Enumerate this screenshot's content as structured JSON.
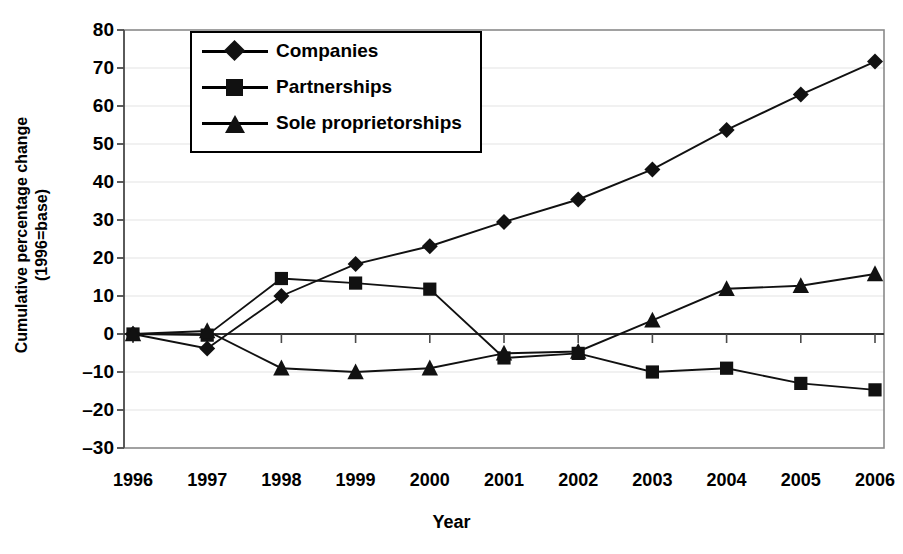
{
  "chart_data": {
    "type": "line",
    "title": "",
    "xlabel": "Year",
    "ylabel_line1": "Cumulative percentage change",
    "ylabel_line2": "(1996=base)",
    "categories": [
      "1996",
      "1997",
      "1998",
      "1999",
      "2000",
      "2001",
      "2002",
      "2003",
      "2004",
      "2005",
      "2006"
    ],
    "x": [
      1996,
      1997,
      1998,
      1999,
      2000,
      2001,
      2002,
      2003,
      2004,
      2005,
      2006
    ],
    "xlim": [
      1996,
      2006
    ],
    "ylim": [
      -30,
      80
    ],
    "yticks": [
      80,
      70,
      60,
      50,
      40,
      30,
      20,
      10,
      0,
      -10,
      -20,
      -30
    ],
    "ytick_labels": [
      "80",
      "70",
      "60",
      "50",
      "40",
      "30",
      "20",
      "10",
      "0",
      "–10",
      "–20",
      "–30"
    ],
    "grid": true,
    "grid_axis": "y",
    "legend_position": "top-left-inside",
    "zero_line": true,
    "series": [
      {
        "name": "Companies",
        "marker": "diamond",
        "values": [
          0,
          -3.8,
          10.0,
          18.4,
          23.1,
          29.5,
          35.4,
          43.3,
          53.7,
          63.0,
          71.7
        ]
      },
      {
        "name": "Partnerships",
        "marker": "square",
        "values": [
          0,
          -0.3,
          14.6,
          13.4,
          11.8,
          -6.3,
          -5.1,
          -10.0,
          -9.0,
          -13.0,
          -14.7
        ]
      },
      {
        "name": "Sole proprietorships",
        "marker": "triangle",
        "values": [
          0,
          0.8,
          -9.0,
          -10.0,
          -9.0,
          -5.1,
          -4.6,
          3.6,
          11.9,
          12.7,
          15.8
        ]
      }
    ]
  },
  "legend": {
    "entries": [
      {
        "label": "Companies",
        "marker": "diamond"
      },
      {
        "label": "Partnerships",
        "marker": "square"
      },
      {
        "label": "Sole proprietorships",
        "marker": "triangle"
      }
    ]
  }
}
